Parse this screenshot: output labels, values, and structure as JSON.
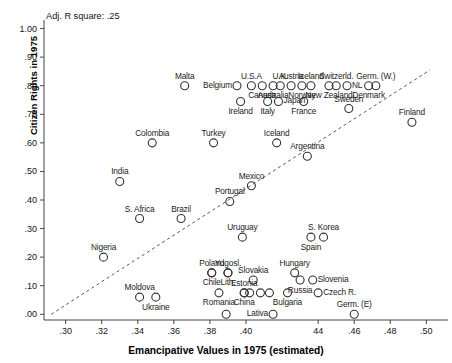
{
  "chart_data": {
    "type": "scatter",
    "title": "",
    "annotation": "Adj. R square: .25",
    "xlabel": "Emancipative Values in 1975 (estimated)",
    "ylabel": "Citizen Rights in 1975",
    "xlim": [
      0.288,
      0.512
    ],
    "ylim": [
      -0.02,
      1.03
    ],
    "xticks": [
      ".30",
      ".32",
      ".34",
      ".36",
      ".38",
      ".40",
      "44",
      ".46",
      ".48",
      ".50"
    ],
    "xtick_values": [
      0.3,
      0.32,
      0.34,
      0.36,
      0.38,
      0.4,
      0.44,
      0.46,
      0.48,
      0.5
    ],
    "yticks": [
      ".00",
      ".10",
      ".20",
      ".30",
      ".40",
      ".50",
      ".60",
      ".70",
      ".80",
      ".90",
      "1.00"
    ],
    "ytick_values": [
      0.0,
      0.1,
      0.2,
      0.3,
      0.4,
      0.5,
      0.6,
      0.7,
      0.8,
      0.9,
      1.0
    ],
    "grid": false,
    "legend": null,
    "trendline": {
      "style": "dashed",
      "x0": 0.292,
      "y0": 0.0,
      "x1": 0.502,
      "y1": 0.855
    },
    "marker": {
      "shape": "circle-open",
      "radius": 4,
      "color": "#333333"
    },
    "points": [
      {
        "label": "Malta",
        "x": 0.366,
        "y": 0.8,
        "label_pos": "top"
      },
      {
        "label": "U.S.A",
        "x": 0.403,
        "y": 0.8,
        "label_pos": "top"
      },
      {
        "label": "U.K.",
        "x": 0.419,
        "y": 0.8,
        "label_pos": "top"
      },
      {
        "label": "Austria",
        "x": 0.425,
        "y": 0.8,
        "label_pos": "top"
      },
      {
        "label": "Iceland",
        "x": 0.436,
        "y": 0.8,
        "label_pos": "top"
      },
      {
        "label": "Switzerld.",
        "x": 0.45,
        "y": 0.8,
        "label_pos": "top"
      },
      {
        "label": "Germ. (W.)",
        "x": 0.472,
        "y": 0.8,
        "label_pos": "top"
      },
      {
        "label": "Belgium",
        "x": 0.395,
        "y": 0.8,
        "label_pos": "left"
      },
      {
        "label": "NL",
        "x": 0.456,
        "y": 0.8,
        "label_pos": "right"
      },
      {
        "label": "Canada",
        "x": 0.409,
        "y": 0.8,
        "label_pos": "bottom"
      },
      {
        "label": "Australia",
        "x": 0.415,
        "y": 0.8,
        "label_pos": "bottom"
      },
      {
        "label": "Norway",
        "x": 0.431,
        "y": 0.8,
        "label_pos": "bottom"
      },
      {
        "label": "New Zealand",
        "x": 0.446,
        "y": 0.8,
        "label_pos": "bottom"
      },
      {
        "label": "Denmark",
        "x": 0.468,
        "y": 0.8,
        "label_pos": "bottom"
      },
      {
        "label": "Ireland",
        "x": 0.397,
        "y": 0.745,
        "label_pos": "bottom"
      },
      {
        "label": "Italy",
        "x": 0.412,
        "y": 0.745,
        "label_pos": "bottom"
      },
      {
        "label": "Japan",
        "x": 0.418,
        "y": 0.745,
        "label_pos": "right"
      },
      {
        "label": "France",
        "x": 0.432,
        "y": 0.745,
        "label_pos": "bottom"
      },
      {
        "label": "Sweden",
        "x": 0.457,
        "y": 0.72,
        "label_pos": "top"
      },
      {
        "label": "Finland",
        "x": 0.492,
        "y": 0.672,
        "label_pos": "top"
      },
      {
        "label": "Colombia",
        "x": 0.348,
        "y": 0.6,
        "label_pos": "top"
      },
      {
        "label": "Turkey",
        "x": 0.382,
        "y": 0.6,
        "label_pos": "top"
      },
      {
        "label": "Iceland",
        "x": 0.417,
        "y": 0.6,
        "label_pos": "top"
      },
      {
        "label": "Argentina",
        "x": 0.434,
        "y": 0.553,
        "label_pos": "top"
      },
      {
        "label": "India",
        "x": 0.33,
        "y": 0.465,
        "label_pos": "top"
      },
      {
        "label": "Mexico",
        "x": 0.403,
        "y": 0.45,
        "label_pos": "top"
      },
      {
        "label": "Portugal",
        "x": 0.391,
        "y": 0.395,
        "label_pos": "top"
      },
      {
        "label": "S. Africa",
        "x": 0.341,
        "y": 0.335,
        "label_pos": "top"
      },
      {
        "label": "Brazil",
        "x": 0.364,
        "y": 0.335,
        "label_pos": "top"
      },
      {
        "label": "Uruguay",
        "x": 0.398,
        "y": 0.27,
        "label_pos": "top"
      },
      {
        "label": "S. Korea",
        "x": 0.443,
        "y": 0.27,
        "label_pos": "top"
      },
      {
        "label": "Spain",
        "x": 0.436,
        "y": 0.27,
        "label_pos": "bottom"
      },
      {
        "label": "Nigeria",
        "x": 0.321,
        "y": 0.2,
        "label_pos": "top"
      },
      {
        "label": "Poland",
        "x": 0.381,
        "y": 0.145,
        "label_pos": "top"
      },
      {
        "label": "Yugosl.",
        "x": 0.39,
        "y": 0.145,
        "label_pos": "top"
      },
      {
        "label": "Slovakia",
        "x": 0.404,
        "y": 0.12,
        "label_pos": "top"
      },
      {
        "label": "Hungary",
        "x": 0.427,
        "y": 0.145,
        "label_pos": "top"
      },
      {
        "label": "Chile",
        "x": 0.381,
        "y": 0.145,
        "label_pos": "bottom"
      },
      {
        "label": "Lith.",
        "x": 0.39,
        "y": 0.145,
        "label_pos": "bottom"
      },
      {
        "label": "Russia",
        "x": 0.43,
        "y": 0.12,
        "label_pos": "bottom"
      },
      {
        "label": "Slovenia",
        "x": 0.437,
        "y": 0.12,
        "label_pos": "right"
      },
      {
        "label": "Estonia",
        "x": 0.399,
        "y": 0.075,
        "label_pos": "top"
      },
      {
        "label": "Czech R.",
        "x": 0.44,
        "y": 0.075,
        "label_pos": "right"
      },
      {
        "label": "Moldova",
        "x": 0.341,
        "y": 0.06,
        "label_pos": "top"
      },
      {
        "label": "Ukraine",
        "x": 0.35,
        "y": 0.06,
        "label_pos": "bottom"
      },
      {
        "label": "Romania",
        "x": 0.385,
        "y": 0.075,
        "label_pos": "bottom"
      },
      {
        "label": "China",
        "x": 0.399,
        "y": 0.075,
        "label_pos": "bottom"
      },
      {
        "label": "Bulgaria",
        "x": 0.423,
        "y": 0.075,
        "label_pos": "bottom"
      },
      {
        "label": "Lativa",
        "x": 0.415,
        "y": 0.0,
        "label_pos": "left"
      },
      {
        "label": "Germ. (E)",
        "x": 0.46,
        "y": 0.0,
        "label_pos": "top"
      },
      {
        "label": "_unlabeled_1",
        "x": 0.389,
        "y": 0.0,
        "label_pos": "none"
      },
      {
        "label": "_unlabeled_2",
        "x": 0.408,
        "y": 0.075,
        "label_pos": "none"
      },
      {
        "label": "_unlabeled_3",
        "x": 0.402,
        "y": 0.075,
        "label_pos": "none"
      },
      {
        "label": "_unlabeled_4",
        "x": 0.413,
        "y": 0.075,
        "label_pos": "none"
      }
    ]
  }
}
